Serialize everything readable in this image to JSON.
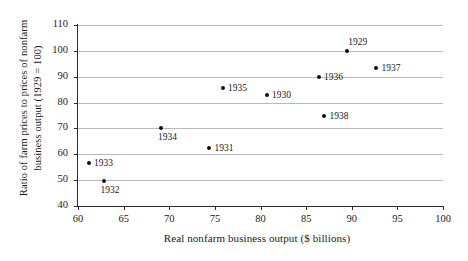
{
  "chart_data": {
    "type": "scatter",
    "title": "",
    "xlabel": "Real nonfarm business output ($ billions)",
    "ylabel_line1": "Ratio of farm prices to prices of nonfarm",
    "ylabel_line2": "business output (1929 = 100)",
    "xlim": [
      60,
      100
    ],
    "ylim": [
      40,
      110
    ],
    "xticks": [
      60,
      65,
      70,
      75,
      80,
      85,
      90,
      95,
      100
    ],
    "yticks": [
      40,
      50,
      60,
      70,
      80,
      90,
      100,
      110
    ],
    "grid": "horizontal",
    "legend": "none",
    "point_color": "#111111",
    "grid_color": "#b9b9b9",
    "axis_color": "#2b2b2b",
    "points": [
      {
        "label": "1933",
        "x": 61.2,
        "y": 56.5,
        "label_pos": "right"
      },
      {
        "label": "1932",
        "x": 62.8,
        "y": 49.5,
        "label_pos": "below"
      },
      {
        "label": "1934",
        "x": 69.1,
        "y": 70.0,
        "label_pos": "below"
      },
      {
        "label": "1931",
        "x": 74.4,
        "y": 62.5,
        "label_pos": "right"
      },
      {
        "label": "1935",
        "x": 75.9,
        "y": 85.5,
        "label_pos": "right"
      },
      {
        "label": "1930",
        "x": 80.7,
        "y": 83.0,
        "label_pos": "right"
      },
      {
        "label": "1936",
        "x": 86.4,
        "y": 90.0,
        "label_pos": "right"
      },
      {
        "label": "1938",
        "x": 87.0,
        "y": 75.0,
        "label_pos": "right"
      },
      {
        "label": "1929",
        "x": 89.5,
        "y": 100.0,
        "label_pos": "above"
      },
      {
        "label": "1937",
        "x": 92.7,
        "y": 93.5,
        "label_pos": "right"
      }
    ]
  }
}
